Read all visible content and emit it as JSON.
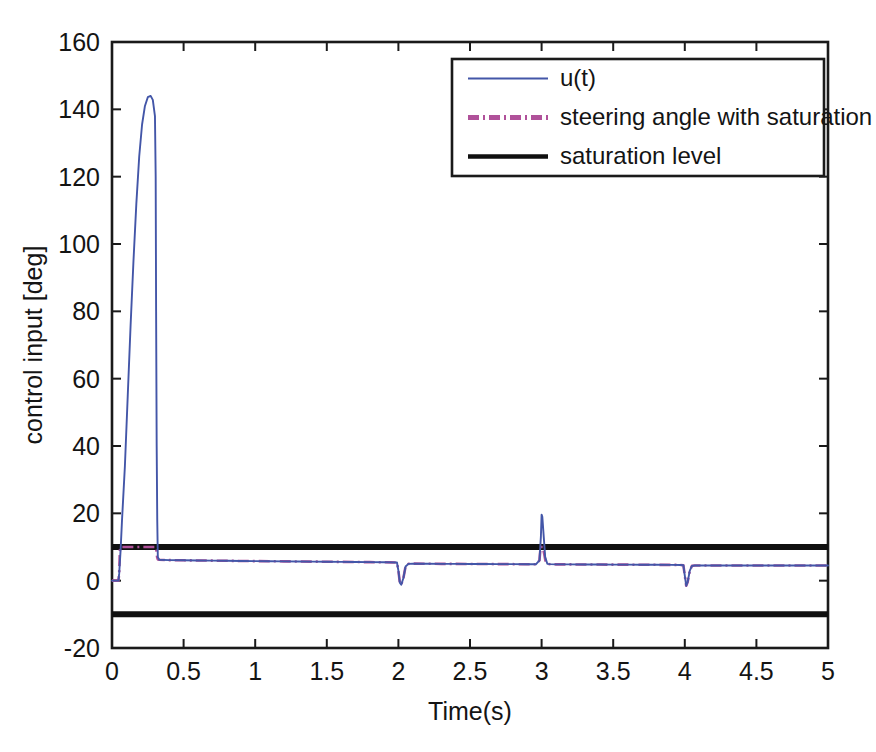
{
  "chart_data": {
    "type": "line",
    "title": "",
    "xlabel": "Time(s)",
    "ylabel": "control input [deg]",
    "xlim": [
      0,
      5
    ],
    "ylim": [
      -20,
      160
    ],
    "xticks": [
      0,
      0.5,
      1,
      1.5,
      2,
      2.5,
      3,
      3.5,
      4,
      4.5,
      5
    ],
    "xticklabels": [
      "0",
      "0.5",
      "1",
      "1.5",
      "2",
      "2.5",
      "3",
      "3.5",
      "4",
      "4.5",
      "5"
    ],
    "yticks": [
      -20,
      0,
      20,
      40,
      60,
      80,
      100,
      120,
      140,
      160
    ],
    "yticklabels": [
      "-20",
      "0",
      "20",
      "40",
      "60",
      "80",
      "100",
      "120",
      "140",
      "160"
    ],
    "grid": false,
    "legend_position": "top-right",
    "saturation_upper": 10,
    "saturation_lower": -10,
    "peak_value": 144,
    "peak_time": 0.28,
    "series": [
      {
        "name": "u(t)",
        "color": "#4356a8",
        "style": "solid",
        "points": [
          [
            0.0,
            0.0
          ],
          [
            0.045,
            0.0
          ],
          [
            0.05,
            2.0
          ],
          [
            0.06,
            9.0
          ],
          [
            0.07,
            18.0
          ],
          [
            0.09,
            34.0
          ],
          [
            0.11,
            55.0
          ],
          [
            0.13,
            76.0
          ],
          [
            0.15,
            95.0
          ],
          [
            0.17,
            112.0
          ],
          [
            0.19,
            126.0
          ],
          [
            0.21,
            135.5
          ],
          [
            0.23,
            141.0
          ],
          [
            0.25,
            143.6
          ],
          [
            0.27,
            144.0
          ],
          [
            0.285,
            142.8
          ],
          [
            0.3,
            138.0
          ],
          [
            0.305,
            120.0
          ],
          [
            0.308,
            80.0
          ],
          [
            0.312,
            40.0
          ],
          [
            0.316,
            18.0
          ],
          [
            0.32,
            7.0
          ],
          [
            0.33,
            6.2
          ],
          [
            0.4,
            6.1
          ],
          [
            0.5,
            6.05
          ],
          [
            0.6,
            6.0
          ],
          [
            0.7,
            5.95
          ],
          [
            0.8,
            5.9
          ],
          [
            0.9,
            5.85
          ],
          [
            1.0,
            5.8
          ],
          [
            1.1,
            5.78
          ],
          [
            1.2,
            5.74
          ],
          [
            1.3,
            5.7
          ],
          [
            1.4,
            5.66
          ],
          [
            1.5,
            5.62
          ],
          [
            1.6,
            5.58
          ],
          [
            1.7,
            5.54
          ],
          [
            1.8,
            5.5
          ],
          [
            1.9,
            5.46
          ],
          [
            1.95,
            5.44
          ],
          [
            1.99,
            5.4
          ],
          [
            2.0,
            3.0
          ],
          [
            2.01,
            -0.6
          ],
          [
            2.02,
            -1.2
          ],
          [
            2.035,
            0.8
          ],
          [
            2.05,
            4.2
          ],
          [
            2.07,
            5.0
          ],
          [
            2.1,
            5.05
          ],
          [
            2.2,
            5.02
          ],
          [
            2.3,
            5.0
          ],
          [
            2.4,
            4.98
          ],
          [
            2.5,
            4.96
          ],
          [
            2.6,
            4.94
          ],
          [
            2.7,
            4.92
          ],
          [
            2.8,
            4.9
          ],
          [
            2.9,
            4.88
          ],
          [
            2.96,
            4.86
          ],
          [
            2.985,
            6.0
          ],
          [
            2.995,
            13.0
          ],
          [
            3.0,
            19.6
          ],
          [
            3.005,
            19.0
          ],
          [
            3.015,
            13.0
          ],
          [
            3.025,
            7.0
          ],
          [
            3.04,
            5.0
          ],
          [
            3.06,
            4.9
          ],
          [
            3.1,
            4.85
          ],
          [
            3.2,
            4.83
          ],
          [
            3.3,
            4.81
          ],
          [
            3.4,
            4.79
          ],
          [
            3.5,
            4.77
          ],
          [
            3.6,
            4.75
          ],
          [
            3.7,
            4.73
          ],
          [
            3.8,
            4.71
          ],
          [
            3.9,
            4.69
          ],
          [
            3.97,
            4.67
          ],
          [
            3.99,
            4.6
          ],
          [
            4.0,
            1.5
          ],
          [
            4.01,
            -1.5
          ],
          [
            4.02,
            -0.4
          ],
          [
            4.035,
            3.0
          ],
          [
            4.05,
            4.4
          ],
          [
            4.07,
            4.5
          ],
          [
            4.1,
            4.5
          ],
          [
            4.2,
            4.5
          ],
          [
            4.4,
            4.5
          ],
          [
            4.6,
            4.5
          ],
          [
            4.8,
            4.5
          ],
          [
            5.0,
            4.5
          ]
        ]
      },
      {
        "name": "steering angle with saturation",
        "color": "#b0519a",
        "style": "dashdot",
        "points": [
          [
            0.0,
            0.0
          ],
          [
            0.045,
            0.0
          ],
          [
            0.05,
            2.0
          ],
          [
            0.055,
            9.0
          ],
          [
            0.06,
            10.0
          ],
          [
            0.08,
            10.0
          ],
          [
            0.15,
            10.0
          ],
          [
            0.25,
            10.0
          ],
          [
            0.305,
            10.0
          ],
          [
            0.31,
            9.0
          ],
          [
            0.315,
            7.0
          ],
          [
            0.32,
            6.3
          ],
          [
            0.33,
            6.2
          ],
          [
            0.4,
            6.1
          ],
          [
            0.5,
            6.05
          ],
          [
            0.6,
            6.0
          ],
          [
            0.7,
            5.95
          ],
          [
            0.8,
            5.9
          ],
          [
            0.9,
            5.85
          ],
          [
            1.0,
            5.8
          ],
          [
            1.1,
            5.78
          ],
          [
            1.2,
            5.74
          ],
          [
            1.3,
            5.7
          ],
          [
            1.4,
            5.66
          ],
          [
            1.5,
            5.62
          ],
          [
            1.6,
            5.58
          ],
          [
            1.7,
            5.54
          ],
          [
            1.8,
            5.5
          ],
          [
            1.9,
            5.46
          ],
          [
            1.95,
            5.44
          ],
          [
            1.99,
            5.4
          ],
          [
            2.0,
            3.0
          ],
          [
            2.01,
            -0.6
          ],
          [
            2.02,
            -1.2
          ],
          [
            2.035,
            0.8
          ],
          [
            2.05,
            4.2
          ],
          [
            2.07,
            5.0
          ],
          [
            2.1,
            5.05
          ],
          [
            2.2,
            5.02
          ],
          [
            2.3,
            5.0
          ],
          [
            2.4,
            4.98
          ],
          [
            2.5,
            4.96
          ],
          [
            2.6,
            4.94
          ],
          [
            2.7,
            4.92
          ],
          [
            2.8,
            4.9
          ],
          [
            2.9,
            4.88
          ],
          [
            2.96,
            4.86
          ],
          [
            2.985,
            6.0
          ],
          [
            2.993,
            10.0
          ],
          [
            3.0,
            10.0
          ],
          [
            3.008,
            10.0
          ],
          [
            3.018,
            8.0
          ],
          [
            3.028,
            5.6
          ],
          [
            3.04,
            5.0
          ],
          [
            3.06,
            4.9
          ],
          [
            3.1,
            4.85
          ],
          [
            3.2,
            4.83
          ],
          [
            3.3,
            4.81
          ],
          [
            3.4,
            4.79
          ],
          [
            3.5,
            4.77
          ],
          [
            3.6,
            4.75
          ],
          [
            3.7,
            4.73
          ],
          [
            3.8,
            4.71
          ],
          [
            3.9,
            4.69
          ],
          [
            3.97,
            4.67
          ],
          [
            3.99,
            4.6
          ],
          [
            4.0,
            1.5
          ],
          [
            4.01,
            -1.5
          ],
          [
            4.02,
            -0.4
          ],
          [
            4.035,
            3.0
          ],
          [
            4.05,
            4.4
          ],
          [
            4.07,
            4.5
          ],
          [
            4.1,
            4.5
          ],
          [
            4.2,
            4.5
          ],
          [
            4.4,
            4.5
          ],
          [
            4.6,
            4.5
          ],
          [
            4.8,
            4.5
          ],
          [
            5.0,
            4.5
          ]
        ]
      },
      {
        "name": "saturation level",
        "color": "#101010",
        "style": "solid",
        "points": [
          [
            0,
            10
          ],
          [
            5,
            10
          ]
        ],
        "points_lower": [
          [
            0,
            -10
          ],
          [
            5,
            -10
          ]
        ]
      }
    ],
    "legend": [
      {
        "label": "u(t)",
        "color": "#4356a8",
        "style": "solid"
      },
      {
        "label": "steering angle with saturation",
        "color": "#b0519a",
        "style": "dashdot"
      },
      {
        "label": "saturation level",
        "color": "#101010",
        "style": "solid"
      }
    ]
  },
  "caption": {
    "text": ""
  }
}
